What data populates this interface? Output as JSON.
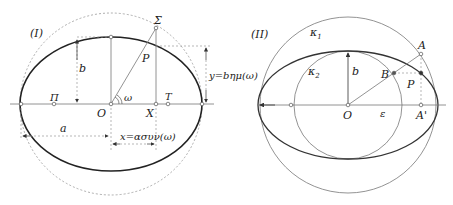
{
  "left_figure": {
    "label": "(I)",
    "points": {
      "Sigma": "Σ",
      "P": "P",
      "O": "O",
      "X": "X",
      "T": "T",
      "Pi": "Π"
    },
    "angle": "ω",
    "semi_minor": "b",
    "semi_major": "a",
    "x_formula": "x=ασυν(ω)",
    "y_formula": "y=bημ(ω)"
  },
  "right_figure": {
    "label": "(II)",
    "circles": {
      "outer": "κ1",
      "inner": "κ2"
    },
    "outer_sub": "1",
    "inner_sub": "2",
    "kappa": "κ",
    "points": {
      "A": "A",
      "B": "B",
      "P": "P",
      "O": "O",
      "A_prime": "A'"
    },
    "semi_minor": "b",
    "epsilon": "ε"
  },
  "colors": {
    "curve": "#222222",
    "thin": "#777777",
    "dashed": "#999999"
  }
}
